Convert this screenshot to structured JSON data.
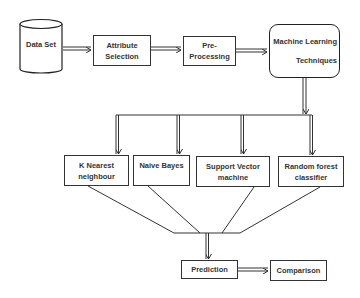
{
  "diagram": {
    "nodes": {
      "dataset": {
        "label": "Data Set",
        "shape": "cylinder"
      },
      "attribute": {
        "line1": "Attribute",
        "line2": "Selection"
      },
      "preprocessing": {
        "line1": "Pre-",
        "line2": "Processing"
      },
      "ml": {
        "line1": "Machine Learning",
        "line2": "Techniques"
      },
      "knn": {
        "line1": "K Nearest",
        "line2": "neighbour"
      },
      "nb": {
        "line1": "Naive Bayes",
        "line2": ""
      },
      "svm": {
        "line1": "Support Vector",
        "line2": "machine"
      },
      "rf": {
        "line1": "Random forest",
        "line2": "classifier"
      },
      "prediction": {
        "label": "Prediction"
      },
      "comparison": {
        "label": "Comparison"
      }
    },
    "edges": [
      [
        "Data Set",
        "Attribute Selection"
      ],
      [
        "Attribute Selection",
        "Pre-Processing"
      ],
      [
        "Pre-Processing",
        "Machine Learning Techniques"
      ],
      [
        "Machine Learning Techniques",
        "K Nearest neighbour"
      ],
      [
        "Machine Learning Techniques",
        "Naive Bayes"
      ],
      [
        "Machine Learning Techniques",
        "Support Vector machine"
      ],
      [
        "Machine Learning Techniques",
        "Random forest classifier"
      ],
      [
        "K Nearest neighbour",
        "Prediction"
      ],
      [
        "Naive Bayes",
        "Prediction"
      ],
      [
        "Support Vector machine",
        "Prediction"
      ],
      [
        "Random forest classifier",
        "Prediction"
      ],
      [
        "Prediction",
        "Comparison"
      ]
    ],
    "colors": {
      "stroke": "#333333",
      "background": "#ffffff",
      "text": "#333333"
    }
  }
}
